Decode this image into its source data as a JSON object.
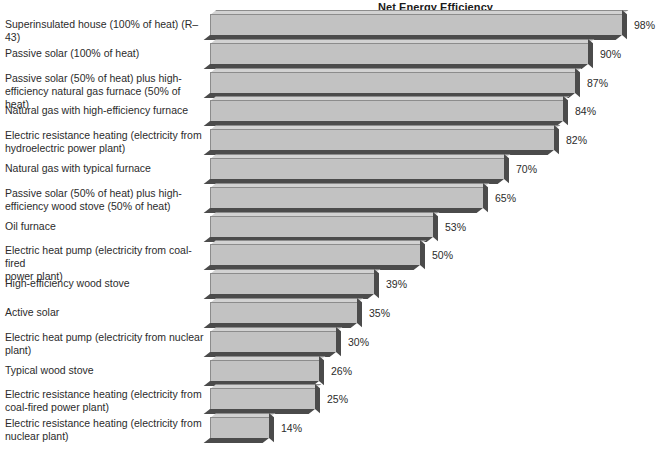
{
  "chart_data": {
    "type": "bar",
    "orientation": "horizontal",
    "title": "Net Energy Efficiency",
    "xlabel": "",
    "ylabel": "",
    "xlim": [
      0,
      100
    ],
    "grid": false,
    "legend": null,
    "value_suffix": "%",
    "categories": [
      "Superinsulated house (100% of heat) (R–43)",
      "Passive solar (100% of heat)",
      "Passive solar (50% of heat) plus high-\nefficiency natural gas furnace (50% of heat)",
      "Natural gas with high-efficiency furnace",
      "Electric resistance heating (electricity from\nhydroelectric power plant)",
      "Natural gas with typical furnace",
      "Passive solar (50% of heat) plus high-\nefficiency wood stove (50% of heat)",
      "Oil furnace",
      "Electric heat pump (electricity from coal-fired\npower plant)",
      "High-efficiency wood stove",
      "Active solar",
      "Electric heat pump (electricity from nuclear\nplant)",
      "Typical wood stove",
      "Electric resistance heating (electricity from\ncoal-fired power plant)",
      "Electric resistance heating (electricity from\nnuclear plant)"
    ],
    "values": [
      98,
      90,
      87,
      84,
      82,
      70,
      65,
      53,
      50,
      39,
      35,
      30,
      26,
      25,
      14
    ],
    "value_labels": [
      "98%",
      "90%",
      "87%",
      "84%",
      "82%",
      "70%",
      "65%",
      "53%",
      "50%",
      "39%",
      "35%",
      "30%",
      "26%",
      "25%",
      "14%"
    ]
  },
  "style": {
    "bar_face_color": "#c2c2c2",
    "bar_top_color": "#d2d2d2",
    "bar_shadow_color": "#4b4b4b",
    "text_color": "#2b2b2b",
    "background": "#ffffff"
  }
}
